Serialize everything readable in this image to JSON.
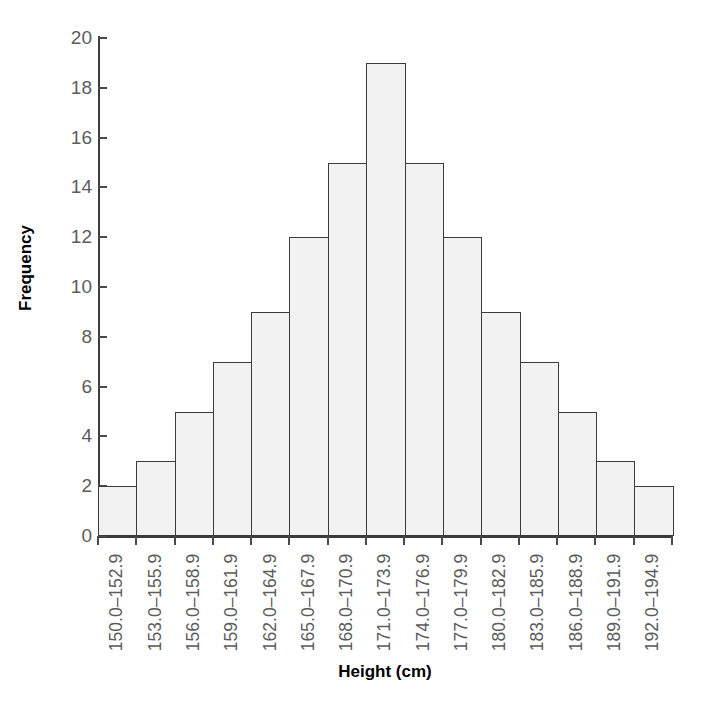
{
  "chart_data": {
    "type": "bar",
    "title": "",
    "subtitle": "",
    "xlabel": "Height (cm)",
    "ylabel": "Frequency",
    "categories": [
      "150.0–152.9",
      "153.0–155.9",
      "156.0–158.9",
      "159.0–161.9",
      "162.0–164.9",
      "165.0–167.9",
      "168.0–170.9",
      "171.0–173.9",
      "174.0–176.9",
      "177.0–179.9",
      "180.0–182.9",
      "183.0–185.9",
      "186.0–188.9",
      "189.0–191.9",
      "192.0–194.9"
    ],
    "values": [
      2,
      3,
      5,
      7,
      9,
      12,
      15,
      19,
      15,
      12,
      9,
      7,
      5,
      3,
      2
    ],
    "ylim": [
      0,
      20
    ],
    "yticks": [
      0,
      2,
      4,
      6,
      8,
      10,
      12,
      14,
      16,
      18,
      20
    ],
    "ytick_labels": [
      "0",
      "2",
      "4",
      "6",
      "8",
      "10",
      "12",
      "14",
      "16",
      "18",
      "20"
    ],
    "grid": false,
    "legend": null,
    "bar_fill_color": "#f2f2f2",
    "bar_edge_color": "#3c3c3c",
    "axis_color": "#3b3b3b",
    "tick_label_color": "#5c5c5c",
    "axis_title_color": "#000000",
    "background_color": "#ffffff",
    "total_count": 125,
    "annotations": []
  },
  "figure": {
    "bottom_artifact_text": ""
  }
}
